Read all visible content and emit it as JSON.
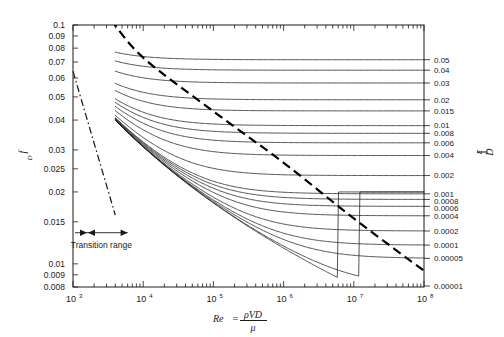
{
  "chart_data": {
    "type": "line",
    "xlabel": "Re = ρVD/μ",
    "ylabel": "f_D",
    "right_axis_label": "ε/D",
    "xscale": "log",
    "yscale": "log",
    "xlim": [
      1000,
      100000000
    ],
    "ylim": [
      0.008,
      0.1
    ],
    "grid": false,
    "legend_position": "right-axis-labels",
    "x_tick_labels": [
      "10³",
      "10⁴",
      "10⁵",
      "10⁶",
      "10⁷",
      "10⁸"
    ],
    "x_tick_bases": [
      "10",
      "10",
      "10",
      "10",
      "10",
      "10"
    ],
    "x_tick_exponents": [
      "3",
      "4",
      "5",
      "6",
      "7",
      "8"
    ],
    "x_tick_values": [
      1000,
      10000,
      100000,
      1000000,
      10000000,
      100000000
    ],
    "y_tick_labels": [
      "0.1",
      "0.09",
      "0.08",
      "0.07",
      "0.06",
      "0.05",
      "0.04",
      "0.03",
      "0.025",
      "0.02",
      "0.015",
      "0.01",
      "0.009",
      "0.008"
    ],
    "y_tick_values": [
      0.1,
      0.09,
      0.08,
      0.07,
      0.06,
      0.05,
      0.04,
      0.03,
      0.025,
      0.02,
      0.015,
      0.01,
      0.009,
      0.008
    ],
    "roughness_labels": [
      "0.05",
      "0.04",
      "0.03",
      "0.02",
      "0.015",
      "0.01",
      "0.008",
      "0.006",
      "0.004",
      "0.002",
      "0.001",
      "0.0008",
      "0.0006",
      "0.0004",
      "0.0002",
      "0.0001",
      "0.00005",
      "0.00001"
    ],
    "roughness_values": [
      0.05,
      0.04,
      0.03,
      0.02,
      0.015,
      0.01,
      0.008,
      0.006,
      0.004,
      0.002,
      0.001,
      0.0008,
      0.0006,
      0.0004,
      0.0002,
      0.0001,
      5e-05,
      1e-05
    ],
    "smooth_pipe_curve": true,
    "turbulent_start_re": 4000,
    "laminar_line": {
      "equation": "f = 64/Re",
      "re_start": 1000,
      "re_end": 4000,
      "style": "dash-dot"
    },
    "complete_turbulence_line": {
      "label": "complete turbulence boundary",
      "style": "heavy-dashed",
      "points": [
        [
          3500,
          0.105
        ],
        [
          10000,
          0.073
        ],
        [
          100000,
          0.0435
        ],
        [
          1000000,
          0.0265
        ],
        [
          10000000,
          0.0155
        ],
        [
          100000000,
          0.00935
        ]
      ]
    },
    "annotations": [
      {
        "text": "Transition range",
        "x_re": 2500,
        "y_f": 0.0135
      }
    ]
  },
  "axis": {
    "y_label_main": "f",
    "y_label_sub": "D",
    "x_label_re": "Re",
    "x_label_eq": "=",
    "x_label_num": "ρVD",
    "x_label_den": "μ",
    "right_label_eps": "ε",
    "right_label_d": "D"
  },
  "notes": {
    "transition_range": "Transition range"
  },
  "colors": {
    "ink": "#1a1a1a",
    "background": "#ffffff",
    "heavy_dash": "#000000"
  }
}
